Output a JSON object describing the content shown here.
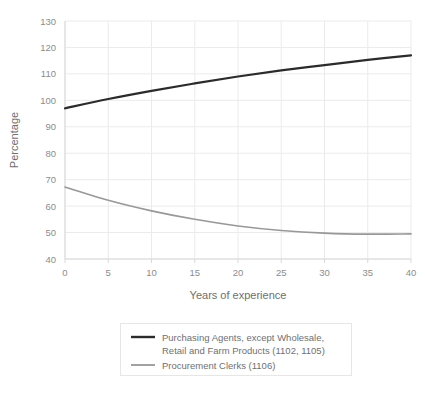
{
  "chart_data": {
    "type": "line",
    "title": "",
    "xlabel": "Years of experience",
    "ylabel": "Percentage",
    "xlim": [
      0,
      40
    ],
    "ylim": [
      40,
      130
    ],
    "xticks": [
      0,
      5,
      10,
      15,
      20,
      25,
      30,
      35,
      40
    ],
    "yticks": [
      40,
      50,
      60,
      70,
      80,
      90,
      100,
      110,
      120,
      130
    ],
    "grid": true,
    "legend_position": "below-axes",
    "x": [
      0,
      5,
      10,
      15,
      20,
      25,
      30,
      35,
      40
    ],
    "series": [
      {
        "name": "Purchasing Agents, except Wholesale, Retail and Farm Products (1102, 1105)",
        "color": "#2b2b2b",
        "linewidth": 2.2,
        "values": [
          97,
          100.5,
          103.6,
          106.4,
          109,
          111.3,
          113.3,
          115.3,
          117
        ]
      },
      {
        "name": "Procurement Clerks (1106)",
        "color": "#989898",
        "linewidth": 1.6,
        "values": [
          67.2,
          62.2,
          58.2,
          55,
          52.5,
          50.8,
          49.8,
          49.4,
          49.5
        ]
      }
    ]
  },
  "axes": {
    "y_title": "Percentage",
    "x_title": "Years of experience",
    "x_tick_labels": [
      "0",
      "5",
      "10",
      "15",
      "20",
      "25",
      "30",
      "35",
      "40"
    ],
    "y_tick_labels": [
      "40",
      "50",
      "60",
      "70",
      "80",
      "90",
      "100",
      "110",
      "120",
      "130"
    ]
  },
  "legend": {
    "entries": [
      {
        "line1": "Purchasing Agents, except Wholesale,",
        "line2": "Retail and Farm Products (1102, 1105)",
        "swatch_color": "#2b2b2b"
      },
      {
        "line1": "Procurement Clerks (1106)",
        "line2": "",
        "swatch_color": "#989898"
      }
    ]
  },
  "colors": {
    "background": "#ffffff",
    "grid": "#e8e8e8",
    "axis": "#d8d8d8",
    "tick_label": "#8c8c8c",
    "axis_title": "#6e6e6e",
    "legend_border": "#e3e3e3",
    "series_1": "#2b2b2b",
    "series_2": "#989898"
  }
}
